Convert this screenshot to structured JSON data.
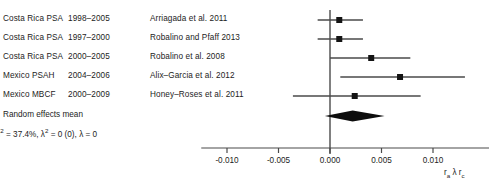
{
  "chart_data": {
    "type": "forest",
    "title": "",
    "xlabel": "r_a λ r_c",
    "xlabel_parts": {
      "lead": "r",
      "sub1": "a",
      "mid": "λ",
      "trail": "r",
      "sub2": "c"
    },
    "xlim": [
      -0.0125,
      0.0155
    ],
    "xticks": [
      -0.01,
      -0.005,
      0.0,
      0.005,
      0.01
    ],
    "xtick_labels": [
      "-0.010",
      "-0.005",
      "0.000",
      "0.005",
      "0.010"
    ],
    "grid": false,
    "reference_line": 0.0,
    "columns": [
      "Study",
      "Years",
      "Citation"
    ],
    "rows": [
      {
        "study": "Costa Rica PSA",
        "years": "1998–2005",
        "citation": "Arriagada et al. 2011",
        "estimate": 0.0009,
        "ci_low": -0.0012,
        "ci_high": 0.0032
      },
      {
        "study": "Costa Rica PSA",
        "years": "1997–2000",
        "citation": "Robalino and Pfaff 2013",
        "estimate": 0.0009,
        "ci_low": -0.0012,
        "ci_high": 0.0032
      },
      {
        "study": "Costa Rica PSA",
        "years": "2000–2005",
        "citation": "Robalino et al. 2008",
        "estimate": 0.004,
        "ci_low": 0.0,
        "ci_high": 0.0078
      },
      {
        "study": "Mexico PSAH",
        "years": "2004–2006",
        "citation": "Alix–Garcia et al. 2012",
        "estimate": 0.0068,
        "ci_low": 0.001,
        "ci_high": 0.0131
      },
      {
        "study": "Mexico MBCF",
        "years": "2000–2009",
        "citation": "Honey–Roses et al. 2011",
        "estimate": 0.0024,
        "ci_low": -0.0036,
        "ci_high": 0.0088
      }
    ],
    "pooled": {
      "label": "Random effects mean",
      "estimate": 0.0022,
      "ci_low": -0.0005,
      "ci_high": 0.0053
    },
    "heterogeneity": {
      "i_squared_label": "I",
      "i_squared_sup": "2",
      "i_squared_value": "37.4%",
      "tau_symbol": "λ",
      "tau_sup": "2",
      "tau_value": "0 (0)",
      "lambda_symbol": "λ",
      "lambda_value": "0",
      "text": "I² = 37.4%, λ² = 0 (0), λ = 0"
    },
    "colors": {
      "marker": "#141414",
      "line": "#4a4a4a",
      "diamond": "#0d0d0d",
      "axis": "#4a4a4a",
      "text": "#1c1c1c"
    }
  }
}
